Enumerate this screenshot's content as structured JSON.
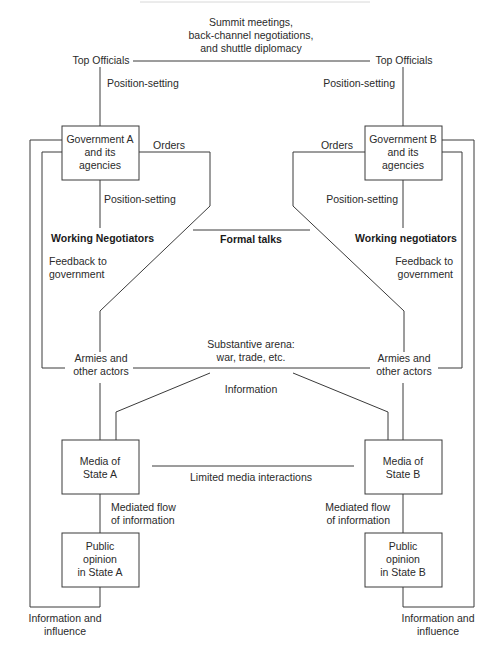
{
  "diagram": {
    "top_channel": {
      "lines": [
        "Summit meetings,",
        "back-channel negotiations,",
        "and shuttle diplomacy"
      ]
    },
    "state_a": {
      "top_officials": "Top Officials",
      "position_setting_top": "Position-setting",
      "government_box": [
        "Government A",
        "and its",
        "agencies"
      ],
      "orders": "Orders",
      "position_setting_mid": "Position-setting",
      "working_negotiators": "Working Negotiators",
      "feedback": [
        "Feedback to",
        "government"
      ],
      "armies": [
        "Armies and",
        "other actors"
      ],
      "media_box": [
        "Media of",
        "State A"
      ],
      "mediated_flow": [
        "Mediated flow",
        "of information"
      ],
      "public_box": [
        "Public",
        "opinion",
        "in State A"
      ],
      "info_influence": [
        "Information and",
        "influence"
      ]
    },
    "state_b": {
      "top_officials": "Top Officials",
      "position_setting_top": "Position-setting",
      "government_box": [
        "Government B",
        "and its",
        "agencies"
      ],
      "orders": "Orders",
      "position_setting_mid": "Position-setting",
      "working_negotiators": "Working negotiators",
      "feedback": [
        "Feedback to",
        "government"
      ],
      "armies": [
        "Armies and",
        "other actors"
      ],
      "media_box": [
        "Media of",
        "State B"
      ],
      "mediated_flow": [
        "Mediated flow",
        "of information"
      ],
      "public_box": [
        "Public",
        "opinion",
        "in State B"
      ],
      "info_influence": [
        "Information and",
        "influence"
      ]
    },
    "center": {
      "formal_talks": "Formal talks",
      "substantive_arena": [
        "Substantive arena:",
        "war, trade, etc."
      ],
      "information": "Information",
      "limited_media": "Limited media interactions"
    },
    "colors": {
      "line": "#3a3a3a",
      "text": "#2a2a2a",
      "background": "#ffffff"
    }
  }
}
